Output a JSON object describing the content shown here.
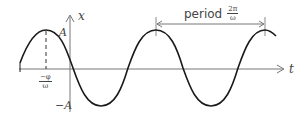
{
  "diagram": {
    "axes": {
      "horizontal_label": "t",
      "vertical_label": "x"
    },
    "labels": {
      "amplitude_pos": "A",
      "amplitude_neg": "−A",
      "phase_num": "−φ",
      "phase_den": "ω",
      "period_word": "period",
      "period_num": "2π",
      "period_den": "ω"
    },
    "colors": {
      "curve": "#1a1a1a",
      "axes": "#777777",
      "text": "#444444",
      "background": "#ffffff"
    }
  }
}
